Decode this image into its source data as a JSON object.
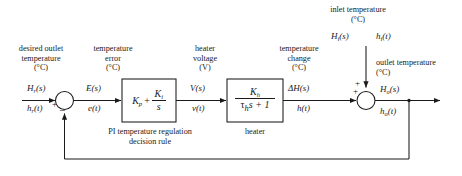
{
  "diagram": {
    "type": "control-system-block-diagram",
    "line_color": "#1a1a1a",
    "background_color": "#ffffff"
  },
  "captions": {
    "desired_outlet": {
      "line1": "desired outlet",
      "line2": "temperature",
      "line3": "(°C)"
    },
    "temperature_error": {
      "line1": "temperature",
      "line2": "error",
      "line3": "(°C)"
    },
    "heater_voltage": {
      "line1": "heater",
      "line2": "voltage",
      "line3": "(V)"
    },
    "temperature_change": {
      "line1": "temperature",
      "line2": "change",
      "line3": "(°C)"
    },
    "inlet_temperature": {
      "line1": "inlet temperature",
      "line2": "(°C)"
    },
    "outlet_temperature": {
      "line1": "outlet temperature",
      "line2": "(°C)"
    }
  },
  "signals": {
    "reference_laplace": {
      "base": "H",
      "sub": "r",
      "arg": "(s)"
    },
    "reference_time": {
      "base": "h",
      "sub": "r",
      "arg": "(t)"
    },
    "error_laplace": {
      "base": "E",
      "sub": "",
      "arg": "(s)"
    },
    "error_time": {
      "base": "e",
      "sub": "",
      "arg": "(t)"
    },
    "voltage_laplace": {
      "base": "V",
      "sub": "",
      "arg": "(s)"
    },
    "voltage_time": {
      "base": "v",
      "sub": "",
      "arg": "(t)"
    },
    "delta_laplace": {
      "base": "ΔH",
      "sub": "",
      "arg": "(s)"
    },
    "delta_time": {
      "base": "h",
      "sub": "",
      "arg": "(t)"
    },
    "inlet_laplace": {
      "base": "H",
      "sub": "i",
      "arg": "(s)"
    },
    "inlet_time": {
      "base": "h",
      "sub": "i",
      "arg": "(t)"
    },
    "outlet_laplace": {
      "base": "H",
      "sub": "o",
      "arg": "(s)"
    },
    "outlet_time": {
      "base": "h",
      "sub": "o",
      "arg": "(t)"
    }
  },
  "blocks": {
    "controller": {
      "caption_line1": "PI temperature regulation",
      "caption_line2": "decision rule",
      "proportional_gain": {
        "base": "K",
        "sub": "p"
      },
      "operator": "+",
      "integral_gain_num": {
        "base": "K",
        "sub": "i"
      },
      "integral_gain_den": "s"
    },
    "heater": {
      "caption": "heater",
      "numerator": {
        "base": "K",
        "sub": "h"
      },
      "denominator_tau": "τ",
      "denominator_tau_sub": "h",
      "denominator_rest": "s + 1"
    }
  },
  "summing_junctions": {
    "error_junction": {
      "name": "error-summing-junction",
      "reference_sign": "+",
      "feedback_sign": "−"
    },
    "output_junction": {
      "name": "output-summing-junction",
      "inlet_sign": "+",
      "forward_sign": "+"
    }
  }
}
